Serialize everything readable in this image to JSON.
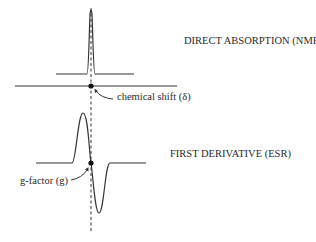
{
  "diagram": {
    "labels": {
      "nmr": "DIRECT ABSORPTION (NMR)",
      "esr": "FIRST DERIVATIVE (ESR)",
      "chemical_shift": "chemical shift (δ)",
      "g_factor": "g-factor (g)"
    },
    "colors": {
      "line": "#333333",
      "background": "#ffffff",
      "text": "#2a2a2a"
    },
    "geometry": {
      "center_x": 91,
      "nmr_baseline_y": 74,
      "nmr_peak_y": 10,
      "axis_y": 86,
      "esr_baseline_y": 163,
      "esr_max_y": 113,
      "esr_min_y": 213,
      "dashed_line_top": 8,
      "dashed_line_bottom": 232
    }
  }
}
